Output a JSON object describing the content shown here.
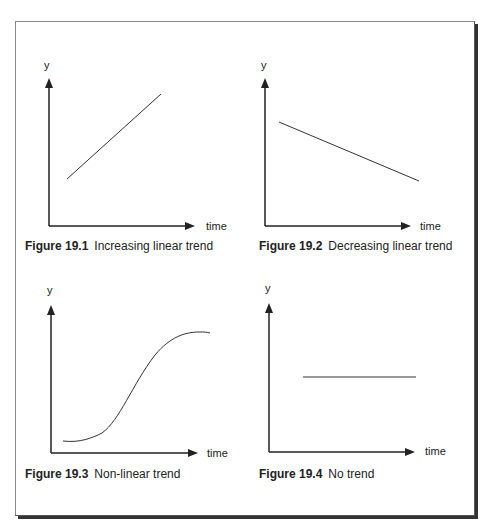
{
  "figures": [
    {
      "number": "Figure 19.1",
      "title": "Increasing linear trend",
      "y_label": "y",
      "x_label": "time"
    },
    {
      "number": "Figure 19.2",
      "title": "Decreasing linear trend",
      "y_label": "y",
      "x_label": "time"
    },
    {
      "number": "Figure 19.3",
      "title": "Non-linear trend",
      "y_label": "y",
      "x_label": "time"
    },
    {
      "number": "Figure 19.4",
      "title": "No trend",
      "y_label": "y",
      "x_label": "time"
    }
  ],
  "colors": {
    "line": "#333333",
    "axis": "#222222",
    "frame_shadow": "#333333"
  }
}
